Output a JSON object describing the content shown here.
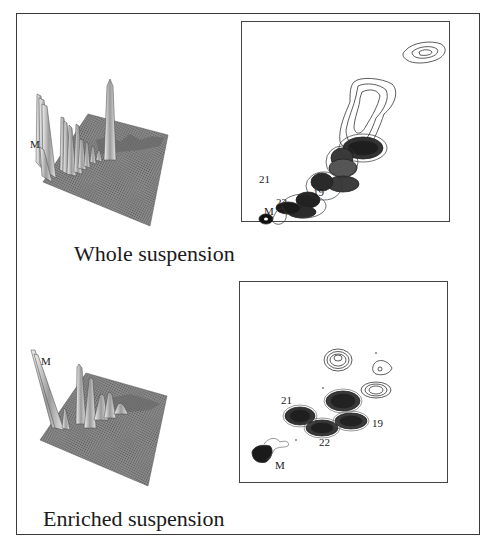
{
  "figure": {
    "panels": [
      {
        "id": "whole",
        "caption": "Whole suspension",
        "surface_plot": {
          "peak_label": "M"
        },
        "contour_plot": {
          "spot_labels": {
            "s21": "21",
            "s19": "19",
            "s22": "22",
            "sM": "M"
          }
        }
      },
      {
        "id": "enriched",
        "caption": "Enriched suspension",
        "surface_plot": {
          "peak_label": "M"
        },
        "contour_plot": {
          "spot_labels": {
            "s21": "21",
            "s19": "19",
            "s22": "22",
            "sM": "M"
          }
        }
      }
    ]
  },
  "colors": {
    "ink": "#1a1a1a",
    "surface_fill": "#7a7a7a",
    "surface_light": "#d8d8d8",
    "contour_dark": "#222222"
  }
}
